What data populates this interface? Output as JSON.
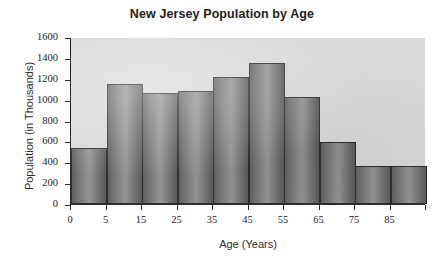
{
  "chart_data": {
    "type": "bar",
    "title": "New Jersey Population by Age",
    "xlabel": "Age (Years)",
    "ylabel": "Population (in Thousands)",
    "categories": [
      "0-5",
      "5-15",
      "15-25",
      "25-35",
      "35-45",
      "45-55",
      "55-65",
      "65-75",
      "75-85",
      "85+"
    ],
    "values": [
      540,
      1150,
      1065,
      1085,
      1215,
      1350,
      1030,
      590,
      365,
      365
    ],
    "bar_count": 10,
    "ylim": [
      0,
      1600
    ],
    "yticks": [
      0,
      200,
      400,
      600,
      800,
      1000,
      1200,
      1400,
      1600
    ],
    "ytick_labels": [
      "0",
      "200",
      "400",
      "600",
      "800",
      "1000",
      "1200",
      "1400",
      "1600"
    ],
    "xtick_labels": [
      "0",
      "5",
      "15",
      "25",
      "35",
      "45",
      "55",
      "65",
      "75",
      "85"
    ],
    "grid": false,
    "legend": null,
    "bars": [
      {
        "label": "0",
        "value": 540
      },
      {
        "label": "5",
        "value": 1150
      },
      {
        "label": "15",
        "value": 1065
      },
      {
        "label": "25",
        "value": 1085
      },
      {
        "label": "35",
        "value": 1215
      },
      {
        "label": "45",
        "value": 1350
      },
      {
        "label": "55",
        "value": 1030
      },
      {
        "label": "65",
        "value": 590
      },
      {
        "label": "75",
        "value": 365
      },
      {
        "label": "85",
        "value": 365
      }
    ],
    "colors": {
      "plot_background": "#d9d9d9",
      "bar_fill_light": "#949494",
      "bar_fill_dark": "#5a5a5a",
      "bar_edge": "#2e2e2e",
      "axis": "#2a2a2a",
      "text": "#1d1d1d",
      "page_background": "#ffffff"
    }
  }
}
